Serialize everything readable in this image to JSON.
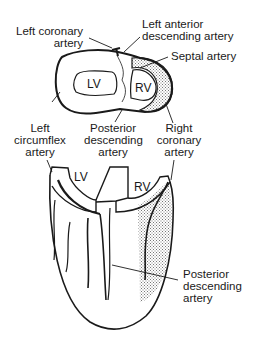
{
  "diagram": {
    "cross_section": {
      "chambers": {
        "lv": "LV",
        "rv": "RV"
      },
      "labels": {
        "left_coronary": [
          "Left coronary",
          "artery"
        ],
        "lad": [
          "Left anterior",
          "descending artery"
        ],
        "septal": [
          "Septal artery"
        ],
        "left_circumflex": [
          "Left",
          "circumflex",
          "artery"
        ],
        "posterior_descending": [
          "Posterior",
          "descending",
          "artery"
        ],
        "right_coronary": [
          "Right",
          "coronary",
          "artery"
        ]
      }
    },
    "posterior_view": {
      "chambers": {
        "lv": "LV",
        "rv": "RV"
      },
      "labels": {
        "posterior_descending": [
          "Posterior",
          "descending",
          "artery"
        ]
      }
    },
    "colors": {
      "line": "#1a1a1a",
      "stipple": "#9a9a9a",
      "background": "#ffffff"
    }
  }
}
